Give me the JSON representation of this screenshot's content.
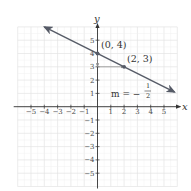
{
  "chart_data": {
    "type": "line",
    "title": "",
    "xlabel": "x",
    "ylabel": "y",
    "xlim": [
      -6,
      6
    ],
    "ylim": [
      -6,
      6
    ],
    "grid": true,
    "x_ticks": [
      -5,
      -4,
      -3,
      -2,
      -1,
      1,
      2,
      3,
      4,
      5
    ],
    "y_ticks": [
      -5,
      -4,
      -3,
      -2,
      -1,
      1,
      2,
      3,
      4,
      5
    ],
    "x_tick_labels": [
      "−5",
      "−4",
      "−3",
      "−2",
      "−1",
      "1",
      "2",
      "3",
      "4",
      "5"
    ],
    "y_tick_labels": [
      "−5",
      "−4",
      "−3",
      "−2",
      "−1",
      "1",
      "2",
      "3",
      "4",
      "5"
    ],
    "series": [
      {
        "name": "line",
        "equation": "y = -1/2 x + 4",
        "slope": -0.5,
        "intercept": 4,
        "x_range": [
          -4,
          5.8
        ],
        "arrows": "both",
        "color": "#555a66"
      }
    ],
    "points": [
      {
        "x": 0,
        "y": 4,
        "label": "(0, 4)"
      },
      {
        "x": 2,
        "y": 3,
        "label": "(2, 3)"
      }
    ],
    "slope_annotation": {
      "prefix": "m = −",
      "numerator": "1",
      "denominator": "2"
    },
    "run_rise_arrows": [
      {
        "from": [
          0,
          4
        ],
        "to": [
          0,
          3
        ],
        "direction": "down"
      },
      {
        "from": [
          0,
          3
        ],
        "to": [
          2,
          3
        ],
        "direction": "right"
      }
    ],
    "colors": {
      "grid": "#e4e4e4",
      "axis": "#333333",
      "line": "#555a66",
      "helper": "#8a8a8a"
    }
  }
}
